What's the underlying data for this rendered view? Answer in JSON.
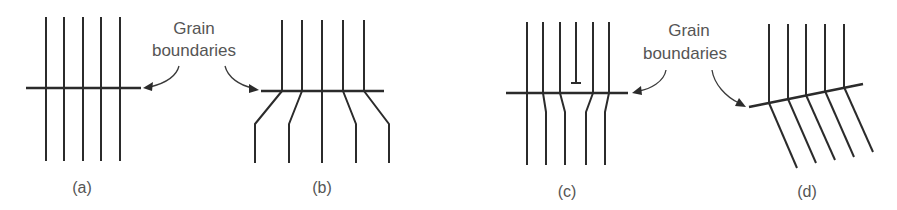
{
  "figure": {
    "labels": {
      "left": {
        "line1": "Grain",
        "line2": "boundaries"
      },
      "right": {
        "line1": "Grain",
        "line2": "boundaries"
      }
    },
    "panels": [
      {
        "id": "a",
        "caption": "(a)",
        "description": "Straight lattice planes crossing a grain boundary without deflection"
      },
      {
        "id": "b",
        "caption": "(b)",
        "description": "Lattice planes bending outward below the grain boundary"
      },
      {
        "id": "c",
        "caption": "(c)",
        "description": "Lattice planes with an edge dislocation above the grain boundary, planes converge below"
      },
      {
        "id": "d",
        "caption": "(d)",
        "description": "Tilted grain boundary with lattice planes rotated below it"
      }
    ],
    "colors": {
      "line": "#2b2b2b",
      "text": "#555555",
      "background": "#ffffff"
    }
  }
}
